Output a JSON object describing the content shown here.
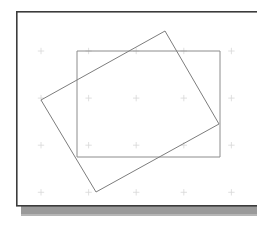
{
  "document": {
    "title": "Rotated Rectangle Overlay Figure",
    "background_color": "#ffffff",
    "width": 257,
    "height": 226
  },
  "page_sheet": {
    "name": "paper-sheet",
    "x": 16,
    "y": 11,
    "width": 241,
    "height": 195,
    "fill": "#ffffff",
    "border_color": "#3c3c3c",
    "border_width": 1.6
  },
  "page_shadow": {
    "name": "paper-shadow",
    "x": 21,
    "y": 206,
    "width": 236,
    "height": 9,
    "fill": "#9a9a9a",
    "edge_fill": "#b5b5b5"
  },
  "grid": {
    "visible": true,
    "tick_glyph": "plus-tick",
    "color": "#d8d8d8",
    "origin_x": 41,
    "origin_y": 51,
    "step_x": 47.6,
    "step_y": 47.1,
    "cols": 5,
    "rows": 4,
    "tick_size": 3.2
  },
  "shapes": [
    {
      "name": "axis-aligned-rectangle",
      "type": "rectangle",
      "stroke": "#8c8c8c",
      "stroke_width": 1.0,
      "fill": "none",
      "x": 77,
      "y": 51,
      "width": 143,
      "height": 106,
      "points": "77,51 220,51 220,157 77,157"
    },
    {
      "name": "rotated-rectangle",
      "type": "polygon",
      "stroke": "#7d7d7d",
      "stroke_width": 1.0,
      "fill": "none",
      "rotation_deg": -20.5,
      "points": "165,31 219,124 96,192 41,100",
      "vertices": [
        {
          "label": "top",
          "x": 165,
          "y": 31
        },
        {
          "label": "right",
          "x": 219,
          "y": 124
        },
        {
          "label": "bottom",
          "x": 96,
          "y": 192
        },
        {
          "label": "left",
          "x": 41,
          "y": 100
        }
      ]
    }
  ]
}
